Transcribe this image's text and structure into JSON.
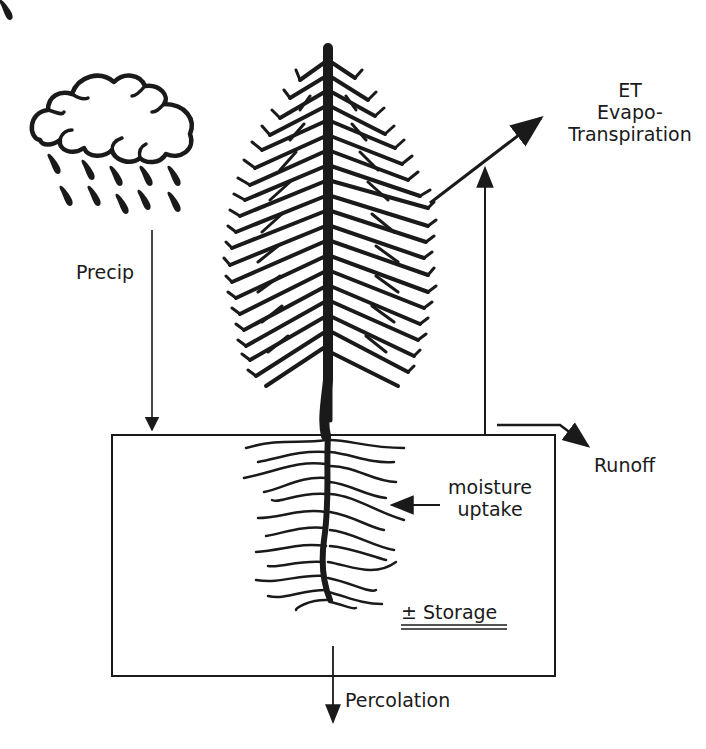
{
  "diagram": {
    "type": "water-balance",
    "elements": {
      "cloud": {
        "name": "rain cloud"
      },
      "tree": {
        "name": "conifer tree"
      },
      "soil_box": {
        "name": "soil storage box"
      }
    },
    "labels": {
      "precip": "Precip",
      "et_line1": "ET",
      "et_line2": "Evapo-",
      "et_line3": "Transpiration",
      "runoff": "Runoff",
      "moisture_line1": "moisture",
      "moisture_line2": "uptake",
      "storage": "± Storage",
      "percolation": "Percolation"
    },
    "flows": [
      {
        "name": "Precip",
        "direction": "down",
        "from": "cloud",
        "to": "soil_box"
      },
      {
        "name": "ET Evapo-Transpiration",
        "direction": "up",
        "from": "tree/soil_box",
        "to": "atmosphere"
      },
      {
        "name": "Runoff",
        "direction": "right",
        "from": "soil_box surface",
        "to": "outside"
      },
      {
        "name": "moisture uptake",
        "direction": "left",
        "from": "soil",
        "to": "roots"
      },
      {
        "name": "Percolation",
        "direction": "down",
        "from": "soil_box",
        "to": "below"
      }
    ],
    "colors": {
      "ink": "#1a1a1a",
      "background": "#ffffff"
    }
  }
}
